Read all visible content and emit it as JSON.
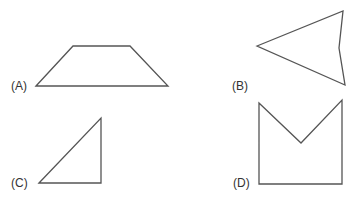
{
  "figures": [
    {
      "label": "(A)",
      "shape": "trapezoid",
      "points": "36,86 73,46 130,46 168,86",
      "label_pos": [
        11,
        80
      ]
    },
    {
      "label": "(B)",
      "shape": "concave quadrilateral (arrowhead)",
      "points": "257,46 343,11 339,48 345,85",
      "label_pos": [
        232,
        80
      ]
    },
    {
      "label": "(C)",
      "shape": "right triangle",
      "points": "39,183 101,118 101,183",
      "label_pos": [
        11,
        177
      ]
    },
    {
      "label": "(D)",
      "shape": "concave pentagon (V-notch)",
      "points": "259,103 301,143 342,100 342,184 259,184",
      "label_pos": [
        233,
        177
      ]
    }
  ],
  "colors": {
    "stroke": "#555555",
    "text": "#333333",
    "background": "#ffffff"
  }
}
